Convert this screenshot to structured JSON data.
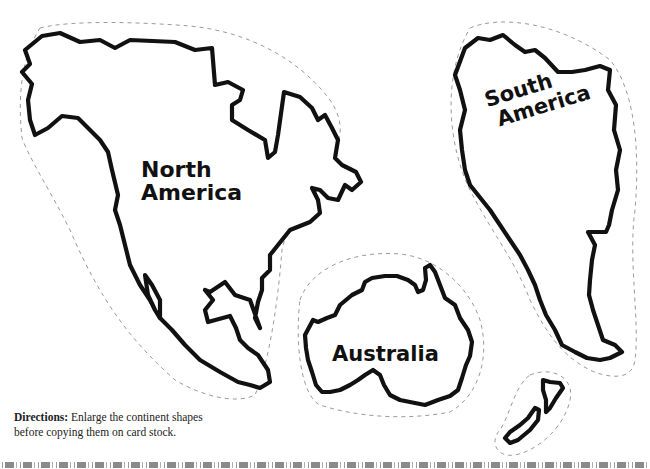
{
  "continents": [
    {
      "name": "North America",
      "line1": "North",
      "line2": "America"
    },
    {
      "name": "South America",
      "line1": "South",
      "line2": "America"
    },
    {
      "name": "Australia",
      "line1": "Australia"
    }
  ],
  "directions": {
    "heading": "Directions:",
    "text_line1": " Enlarge the continent shapes",
    "text_line2": "before copying them on card stock."
  },
  "colors": {
    "outline": "#111111",
    "cut_line": "#9a9a9a",
    "background": "#ffffff"
  }
}
